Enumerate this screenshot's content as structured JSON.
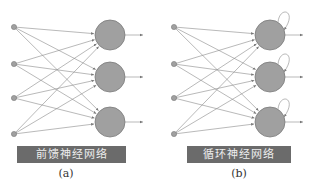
{
  "panels": [
    {
      "id": "a",
      "label": "前馈神经网络",
      "caption": "(a)",
      "recurrent": false
    },
    {
      "id": "b",
      "label": "循环神经网络",
      "caption": "(b)",
      "recurrent": true
    }
  ],
  "colors": {
    "node": "#a0a0a0",
    "node_stroke": "#7a7a7a",
    "edge": "#8a8a8a",
    "bar": "#6b6b6b",
    "bar_text": "#eeeeee"
  }
}
